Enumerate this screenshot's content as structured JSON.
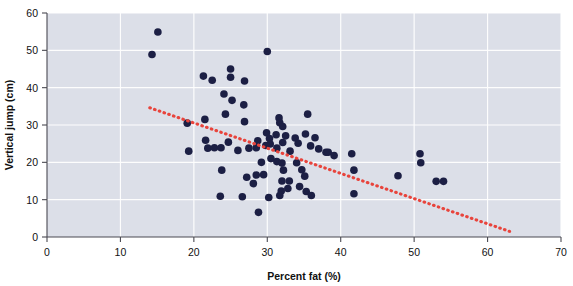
{
  "chart_data": {
    "type": "scatter",
    "title": "",
    "xlabel": "Percent fat (%)",
    "ylabel": "Vertical jump (cm)",
    "xlim": [
      0,
      70
    ],
    "ylim": [
      0,
      60
    ],
    "xticks": [
      0,
      10,
      20,
      30,
      40,
      50,
      60,
      70
    ],
    "yticks": [
      0,
      10,
      20,
      30,
      40,
      50,
      60
    ],
    "grid": true,
    "grid_color": "#ffffff",
    "plot_background": "#dcdfe8",
    "figure_background": "#ffffff",
    "point_color": "#1c1f44",
    "point_size": 5,
    "legend": null,
    "annotations": [],
    "trendline": {
      "style": "dotted",
      "color": "#e8443c",
      "x_start": 14.0,
      "y_start": 34.6,
      "x_end": 63.0,
      "y_end": 1.5
    },
    "points": [
      {
        "x": 14.3,
        "y": 48.9
      },
      {
        "x": 15.1,
        "y": 54.9
      },
      {
        "x": 21.3,
        "y": 43.1
      },
      {
        "x": 22.5,
        "y": 42.0
      },
      {
        "x": 25.0,
        "y": 45.0
      },
      {
        "x": 25.0,
        "y": 42.8
      },
      {
        "x": 26.9,
        "y": 41.8
      },
      {
        "x": 24.1,
        "y": 38.3
      },
      {
        "x": 25.2,
        "y": 36.6
      },
      {
        "x": 26.8,
        "y": 35.4
      },
      {
        "x": 19.1,
        "y": 30.5
      },
      {
        "x": 21.5,
        "y": 31.5
      },
      {
        "x": 24.3,
        "y": 32.9
      },
      {
        "x": 26.9,
        "y": 30.9
      },
      {
        "x": 30.0,
        "y": 49.7
      },
      {
        "x": 31.6,
        "y": 31.9
      },
      {
        "x": 31.7,
        "y": 30.6
      },
      {
        "x": 32.1,
        "y": 29.6
      },
      {
        "x": 29.9,
        "y": 27.9
      },
      {
        "x": 30.3,
        "y": 26.4
      },
      {
        "x": 28.7,
        "y": 25.8
      },
      {
        "x": 31.2,
        "y": 27.4
      },
      {
        "x": 32.5,
        "y": 27.1
      },
      {
        "x": 33.8,
        "y": 26.5
      },
      {
        "x": 35.5,
        "y": 32.9
      },
      {
        "x": 35.2,
        "y": 27.6
      },
      {
        "x": 36.5,
        "y": 26.6
      },
      {
        "x": 19.3,
        "y": 23.0
      },
      {
        "x": 21.6,
        "y": 25.9
      },
      {
        "x": 21.9,
        "y": 23.8
      },
      {
        "x": 22.8,
        "y": 23.9
      },
      {
        "x": 23.7,
        "y": 23.9
      },
      {
        "x": 24.7,
        "y": 25.4
      },
      {
        "x": 26.0,
        "y": 23.2
      },
      {
        "x": 27.5,
        "y": 23.8
      },
      {
        "x": 28.5,
        "y": 23.9
      },
      {
        "x": 29.8,
        "y": 24.5
      },
      {
        "x": 30.4,
        "y": 24.9
      },
      {
        "x": 31.3,
        "y": 23.8
      },
      {
        "x": 32.1,
        "y": 25.3
      },
      {
        "x": 33.1,
        "y": 23.0
      },
      {
        "x": 34.2,
        "y": 25.1
      },
      {
        "x": 35.9,
        "y": 24.4
      },
      {
        "x": 37.0,
        "y": 23.6
      },
      {
        "x": 38.0,
        "y": 22.7
      },
      {
        "x": 38.3,
        "y": 22.7
      },
      {
        "x": 39.1,
        "y": 21.8
      },
      {
        "x": 23.8,
        "y": 17.9
      },
      {
        "x": 27.2,
        "y": 16.0
      },
      {
        "x": 28.5,
        "y": 16.6
      },
      {
        "x": 29.5,
        "y": 16.7
      },
      {
        "x": 28.1,
        "y": 14.3
      },
      {
        "x": 31.3,
        "y": 20.2
      },
      {
        "x": 32.0,
        "y": 19.8
      },
      {
        "x": 32.2,
        "y": 17.9
      },
      {
        "x": 32.0,
        "y": 15.0
      },
      {
        "x": 33.0,
        "y": 15.0
      },
      {
        "x": 31.9,
        "y": 12.3
      },
      {
        "x": 31.7,
        "y": 11.1
      },
      {
        "x": 32.8,
        "y": 13.0
      },
      {
        "x": 34.0,
        "y": 19.9
      },
      {
        "x": 34.7,
        "y": 18.0
      },
      {
        "x": 35.1,
        "y": 16.3
      },
      {
        "x": 34.4,
        "y": 13.5
      },
      {
        "x": 35.3,
        "y": 12.2
      },
      {
        "x": 36.0,
        "y": 11.1
      },
      {
        "x": 23.6,
        "y": 10.9
      },
      {
        "x": 26.6,
        "y": 10.8
      },
      {
        "x": 28.8,
        "y": 6.6
      },
      {
        "x": 30.2,
        "y": 10.6
      },
      {
        "x": 41.5,
        "y": 22.3
      },
      {
        "x": 41.8,
        "y": 17.9
      },
      {
        "x": 41.8,
        "y": 11.6
      },
      {
        "x": 47.8,
        "y": 16.4
      },
      {
        "x": 50.8,
        "y": 22.3
      },
      {
        "x": 50.9,
        "y": 19.9
      },
      {
        "x": 53.0,
        "y": 14.9
      },
      {
        "x": 54.0,
        "y": 14.9
      },
      {
        "x": 30.5,
        "y": 21.0
      },
      {
        "x": 29.2,
        "y": 20.0
      }
    ]
  },
  "axis_titles": {
    "x": "Percent fat (%)",
    "y": "Vertical jump (cm)"
  }
}
